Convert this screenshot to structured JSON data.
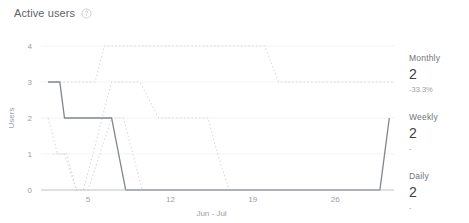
{
  "header": {
    "title": "Active users",
    "help_icon": "help-circle-icon"
  },
  "side_stats": [
    {
      "label": "Monthly",
      "value": "2",
      "delta": "-33.3%"
    },
    {
      "label": "Weekly",
      "value": "2",
      "delta": "-"
    },
    {
      "label": "Daily",
      "value": "2",
      "delta": "-"
    }
  ],
  "chart_data": {
    "type": "line",
    "title": "Active users",
    "xlabel": "Jun - Jul",
    "ylabel": "Users",
    "xlim": [
      1,
      31
    ],
    "ylim": [
      0,
      4
    ],
    "yticks": [
      0,
      1,
      2,
      3,
      4
    ],
    "xticks": [
      5,
      12,
      19,
      26
    ],
    "grid": true,
    "legend": "none",
    "colors": {
      "daily": "#80868b",
      "weekly": "#dadce0",
      "monthly": "#dadce0",
      "axis": "#bdc1c6",
      "grid": "#f1f3f4",
      "text": "#9aa0a6"
    },
    "series": [
      {
        "name": "Monthly",
        "style": "dotted",
        "color": "#dadce0",
        "x": [
          1.6,
          2.0,
          4.2,
          5.6,
          6.4,
          7.2,
          20.0,
          21.2,
          31.0
        ],
        "y": [
          3,
          3,
          3,
          3,
          4,
          4,
          4,
          3,
          3
        ]
      },
      {
        "name": "Weekly",
        "style": "dotted",
        "color": "#dadce0",
        "x": [
          1.6,
          2.4,
          3.2,
          4.0,
          4.6,
          5.4,
          6.2,
          7.0,
          7.6,
          8.4,
          9.4,
          11.0,
          12.0,
          13.4,
          15.2,
          16.0,
          17.0
        ],
        "y": [
          2,
          1,
          1,
          0,
          0,
          1,
          2,
          3,
          3,
          3,
          3,
          2,
          2,
          2,
          2,
          1,
          0
        ]
      },
      {
        "name": "Weekly-secondary",
        "style": "dotted",
        "color": "#dadce0",
        "x": [
          2.0,
          3.0,
          4.0,
          5.0,
          6.0,
          7.0,
          8.0,
          8.8,
          9.6
        ],
        "y": [
          1,
          1,
          0,
          0,
          1,
          2,
          2,
          1,
          0
        ]
      },
      {
        "name": "Daily",
        "style": "solid",
        "color": "#80868b",
        "x": [
          1.6,
          2.6,
          3.0,
          6.2,
          7.0,
          8.2,
          28.8,
          29.8,
          30.6
        ],
        "y": [
          3,
          3,
          2,
          2,
          2,
          0,
          0,
          0,
          2
        ]
      }
    ]
  }
}
